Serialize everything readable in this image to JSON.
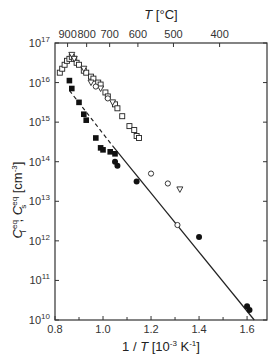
{
  "chart_data": {
    "type": "scatter",
    "title": "",
    "xlabel": "1 / T  [10^-3 K^-1]",
    "ylabel": "C_i^eq, C_s^eq [cm^-3]",
    "top_xlabel": "T  [°C]",
    "xlim": [
      0.8,
      1.683
    ],
    "ylim_log10": [
      10,
      17
    ],
    "yscale": "log",
    "x_ticks": [
      "0.8",
      "1.0",
      "1.2",
      "1.4",
      "1.6"
    ],
    "x_tick_values": [
      0.8,
      1.0,
      1.2,
      1.4,
      1.6
    ],
    "y_ticks": [
      "10^10",
      "10^11",
      "10^12",
      "10^13",
      "10^14",
      "10^15",
      "10^16",
      "10^17"
    ],
    "top_x_ticks": [
      "900",
      "800",
      "700",
      "600",
      "500",
      "400"
    ],
    "top_x_tick_values_C": [
      900,
      800,
      700,
      600,
      500,
      400
    ],
    "grid": false,
    "series": [
      {
        "name": "open squares",
        "marker": "square-open",
        "points_log10": [
          [
            0.82,
            16.25
          ],
          [
            0.83,
            16.35
          ],
          [
            0.84,
            16.45
          ],
          [
            0.85,
            16.55
          ],
          [
            0.86,
            16.6
          ],
          [
            0.87,
            16.65
          ],
          [
            0.88,
            16.6
          ],
          [
            0.89,
            16.5
          ],
          [
            0.9,
            16.45
          ],
          [
            0.92,
            16.3
          ],
          [
            0.93,
            16.25
          ],
          [
            0.95,
            16.15
          ],
          [
            0.96,
            16.1
          ],
          [
            0.98,
            16.0
          ],
          [
            0.99,
            15.95
          ],
          [
            1.01,
            15.75
          ],
          [
            1.02,
            15.65
          ],
          [
            1.05,
            15.45
          ],
          [
            1.06,
            15.35
          ],
          [
            1.08,
            15.15
          ],
          [
            1.11,
            14.9
          ],
          [
            1.13,
            14.8
          ],
          [
            1.14,
            14.65
          ],
          [
            1.15,
            14.6
          ]
        ]
      },
      {
        "name": "open triangles",
        "marker": "triangle-open",
        "points_log10": [
          [
            0.87,
            16.7
          ],
          [
            0.88,
            16.6
          ],
          [
            0.92,
            16.35
          ],
          [
            0.95,
            16.0
          ],
          [
            0.99,
            15.85
          ],
          [
            1.04,
            15.5
          ],
          [
            1.32,
            13.3
          ]
        ]
      },
      {
        "name": "open circles",
        "marker": "circle-open",
        "points_log10": [
          [
            0.97,
            15.9
          ],
          [
            1.02,
            15.6
          ],
          [
            1.2,
            13.7
          ],
          [
            1.27,
            13.45
          ],
          [
            1.31,
            12.4
          ]
        ]
      },
      {
        "name": "filled squares",
        "marker": "square-filled",
        "points_log10": [
          [
            0.86,
            16.05
          ],
          [
            0.87,
            15.85
          ],
          [
            0.9,
            15.5
          ],
          [
            0.92,
            15.2
          ],
          [
            0.93,
            15.05
          ],
          [
            0.97,
            14.6
          ],
          [
            0.99,
            14.35
          ],
          [
            1.0,
            14.3
          ],
          [
            1.03,
            14.25
          ],
          [
            1.05,
            14.2
          ]
        ]
      },
      {
        "name": "filled circles",
        "marker": "circle-filled",
        "points_log10": [
          [
            1.05,
            14.0
          ],
          [
            1.06,
            13.9
          ],
          [
            1.14,
            13.5
          ],
          [
            1.4,
            12.1
          ],
          [
            1.6,
            10.35
          ],
          [
            1.61,
            10.25
          ]
        ]
      }
    ],
    "lines": [
      {
        "name": "fit solid",
        "style": "solid",
        "points_log10": [
          [
            1.04,
            14.4
          ],
          [
            1.63,
            10.0
          ]
        ]
      },
      {
        "name": "fit dashed",
        "style": "dashed",
        "points_log10": [
          [
            0.86,
            15.8
          ],
          [
            1.04,
            14.4
          ]
        ]
      }
    ]
  }
}
